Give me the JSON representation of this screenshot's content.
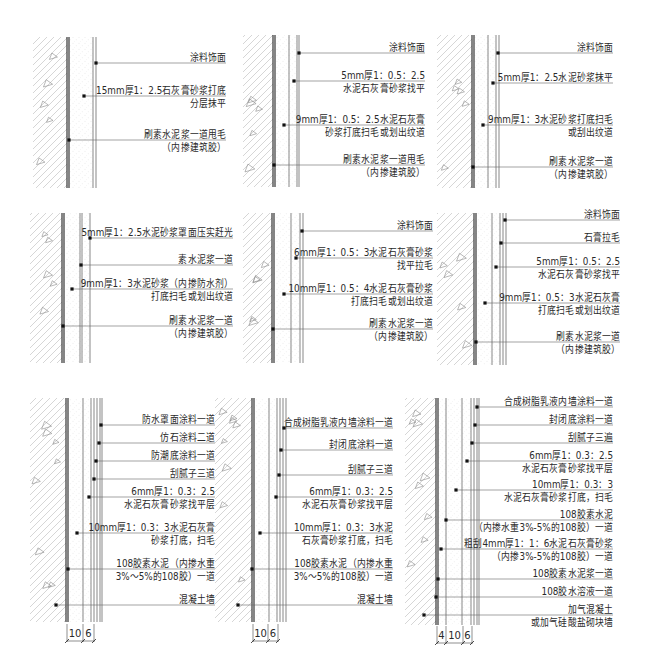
{
  "drawing_title": "内墙面抹灰做法详图",
  "panels": [
    {
      "labels": [
        [
          "涂料饰面"
        ],
        [
          "15mm厚1：2.5石灰膏砂浆打底",
          "分层抹平"
        ],
        [
          "刷素水泥浆一道甩毛",
          "（内掺建筑胶）"
        ]
      ]
    },
    {
      "labels": [
        [
          "涂料饰面"
        ],
        [
          "5mm厚1：0.5：2.5",
          "水泥石灰膏砂浆找平"
        ],
        [
          "9mm厚1：0.5：2.5水泥石灰膏",
          "砂浆打底扫毛或划出纹道"
        ],
        [
          "刷素水泥浆一道甩毛",
          "（内掺建筑胶）"
        ]
      ]
    },
    {
      "labels": [
        [
          "涂料饰面"
        ],
        [
          "5mm厚1：2.5水泥砂浆抹平"
        ],
        [
          "9mm厚1：3水泥砂浆打底扫毛",
          "或刮出纹道"
        ],
        [
          "刷素水泥浆一道",
          "（内掺建筑胶）"
        ]
      ]
    },
    {
      "labels": [
        [
          "5mm厚1：2.5水泥砂浆罩面压实赶光"
        ],
        [
          "素水泥浆一道"
        ],
        [
          "9mm厚1：3水泥砂浆（内掺防水剂）",
          "打底扫毛或划出纹道"
        ],
        [
          "刷素水泥浆一道",
          "（内掺建筑胶）"
        ]
      ]
    },
    {
      "labels": [
        [
          "涂料饰面"
        ],
        [
          "6mm厚1：0.5：3水泥石灰膏砂浆",
          "找平拉毛"
        ],
        [
          "10mm厚1：0.5：4水泥石灰膏砂浆",
          "打底扫毛或划出纹道"
        ],
        [
          "刷素水泥浆一道",
          "（内掺建筑胶）"
        ]
      ]
    },
    {
      "labels": [
        [
          "涂料饰面"
        ],
        [
          "石膏拉毛"
        ],
        [
          "5mm厚1：0.5：2.5",
          "水泥石灰膏砂浆找平"
        ],
        [
          "9mm厚1：0.5：3水泥石灰膏",
          "打底扫毛或划出纹道"
        ],
        [
          "刷素水泥浆一道",
          "（内掺建筑胶）"
        ]
      ]
    },
    {
      "labels": [
        [
          "防水罩面涂料一道"
        ],
        [
          "仿石涂料二道"
        ],
        [
          "防潮底涂料一道"
        ],
        [
          "刮腻子三道"
        ],
        [
          "6mm厚1：0.3：2.5",
          "水泥石灰膏砂浆找平层"
        ],
        [
          "10mm厚1：0.3：3水泥石灰膏",
          "砂浆打底，扫毛"
        ],
        [
          "108胶素水泥（内掺水重",
          "3%～5%的108胶）一道"
        ],
        [
          "混凝土墙"
        ]
      ],
      "dimensions": [
        "10",
        "6"
      ]
    },
    {
      "labels": [
        [
          "合成树脂乳液内墙涂料一道"
        ],
        [
          "封闭底涂料一道"
        ],
        [
          "刮腻子三道"
        ],
        [
          "6mm厚1：0.3：2.5",
          "水泥石灰膏砂浆找平层"
        ],
        [
          "10mm厚1：0.3：3水泥",
          "石灰膏砂浆打底，扫毛"
        ],
        [
          "108胶素水泥（内掺水重",
          "3%～5%的108胶）一道"
        ],
        [
          "混凝土墙"
        ]
      ],
      "dimensions": [
        "10",
        "6"
      ]
    },
    {
      "labels": [
        [
          "合成树脂乳液内墙涂料一道"
        ],
        [
          "封闭底涂料一道"
        ],
        [
          "刮腻子三遍"
        ],
        [
          "6mm厚1：0.3：2.5",
          "水泥石灰膏砂浆找平层"
        ],
        [
          "10mm厚1：0.3：3",
          "水泥石灰膏砂浆打底，扫毛"
        ],
        [
          "108胶素水泥",
          "（内掺水重3%-5%的108胶）一道"
        ],
        [
          "粗刮4mm厚1：1：6水泥石灰膏砂浆",
          "（内掺3%-5%的108胶）一道"
        ],
        [
          "108胶素水泥浆一道"
        ],
        [
          "108胶水溶液一道"
        ],
        [
          "加气混凝土",
          "或加气硅酸盐砌块墙"
        ]
      ],
      "dimensions": [
        "4",
        "10",
        "6"
      ]
    }
  ]
}
